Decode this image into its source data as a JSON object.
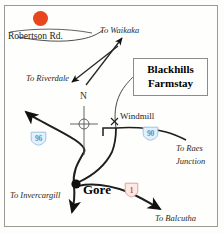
{
  "map": {
    "title": "Blackhills Farmstay location map",
    "frame": {
      "visible": true,
      "border_color": "#9a9a96"
    },
    "site_marker": {
      "name": "Blackhills Farmstay site dot",
      "color": "#e8461e"
    },
    "callout_box": {
      "line1": "Blackhills",
      "line2": "Farmstay"
    },
    "compass": {
      "north_label": "N"
    },
    "places": [
      {
        "id": "gore",
        "label": "Gore"
      }
    ],
    "roads": [
      {
        "id": "robertson-rd",
        "label": "Robertson Rd."
      }
    ],
    "pois": [
      {
        "id": "windmill",
        "label": "Windmill",
        "marker": "x-marker"
      }
    ],
    "directions": [
      {
        "id": "waikaka",
        "label": "To Waikaka"
      },
      {
        "id": "riverdale",
        "label": "To Riverdale"
      },
      {
        "id": "invercargill",
        "label": "To Invercargill"
      },
      {
        "id": "raes-junction-line1",
        "label": "To Raes"
      },
      {
        "id": "raes-junction-line2",
        "label": "Junction"
      },
      {
        "id": "balcutha",
        "label": "To Balcutha"
      }
    ],
    "route_shields": [
      {
        "id": "sh96",
        "number": "96",
        "color": "#5b8fc9",
        "style": "blue-shield"
      },
      {
        "id": "sh90",
        "number": "90",
        "color": "#5b8fc9",
        "style": "blue-shield"
      },
      {
        "id": "sh1",
        "number": "1",
        "color": "#c2564a",
        "style": "red-shield"
      }
    ]
  }
}
